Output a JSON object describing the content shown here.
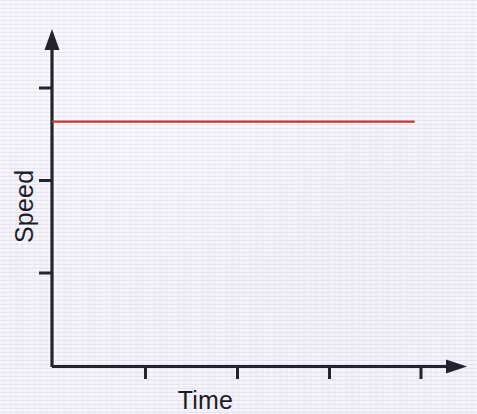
{
  "chart_data": {
    "type": "line",
    "title": "",
    "subtitle": "",
    "xlabel": "Time",
    "ylabel": "Speed",
    "series": [
      {
        "name": "constant-speed",
        "color": "#bf3a2c",
        "x": [
          0,
          1,
          2,
          3,
          4,
          4.05
        ],
        "values": [
          3,
          3,
          3,
          3,
          3,
          3
        ]
      }
    ],
    "x": [
      0,
      1,
      2,
      3,
      4
    ],
    "xtick_labels": [
      "",
      "",
      "",
      "",
      ""
    ],
    "ytick_labels": [
      "",
      "",
      ""
    ],
    "xlim": [
      0,
      4.5
    ],
    "ylim": [
      0,
      4
    ],
    "grid": false,
    "legend": false,
    "legend_position": "none",
    "annotations": [],
    "axis_arrows": true
  },
  "figure": {
    "background_color": "#eeebf6",
    "axis_color": "#23232e",
    "line_color": "#bf3a2c",
    "width": 477,
    "height": 414
  },
  "labels": {
    "y_axis": "Speed",
    "x_axis": "Time"
  }
}
